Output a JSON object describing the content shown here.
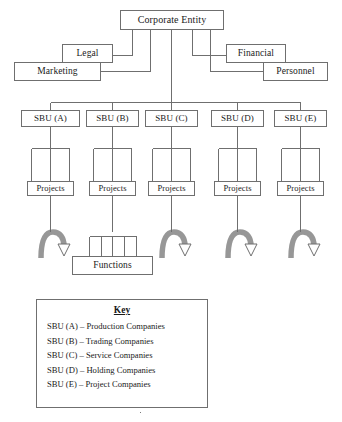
{
  "diagram": {
    "title_node": "Corporate Entity",
    "staff_nodes": [
      {
        "label": "Legal"
      },
      {
        "label": "Financial"
      },
      {
        "label": "Marketing"
      },
      {
        "label": "Personnel"
      }
    ],
    "sbu_nodes": [
      {
        "label": "SBU (A)"
      },
      {
        "label": "SBU (B)"
      },
      {
        "label": "SBU (C)"
      },
      {
        "label": "SBU (D)"
      },
      {
        "label": "SBU (E)"
      }
    ],
    "project_nodes": [
      {
        "label": "Projects"
      },
      {
        "label": "Projects"
      },
      {
        "label": "Projects"
      },
      {
        "label": "Projects"
      },
      {
        "label": "Projects"
      }
    ],
    "functions_node": "Functions",
    "colors": {
      "line": "#6f6f6f",
      "box_border": "#6f6f6f",
      "arrow_fill": "#9a9a9a",
      "arrow_stroke": "#6f6f6f",
      "background": "#ffffff",
      "text": "#1a1a1a"
    }
  },
  "key": {
    "title": "Key",
    "entries": [
      "SBU (A) – Production Companies",
      "SBU (B) – Trading Companies",
      "SBU (C) – Service Companies",
      "SBU (D) – Holding Companies",
      "SBU (E) – Project Companies"
    ]
  }
}
